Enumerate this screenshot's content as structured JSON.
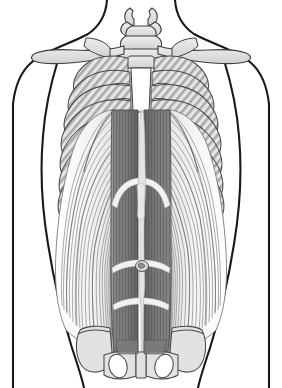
{
  "figure": {
    "view": "anterior",
    "background_color": "#ffffff",
    "outline_color": "#1a1a1a",
    "width": 282,
    "height": 388
  },
  "palette": {
    "body_outline": "#1a1a1a",
    "bone_fill": "#dcdcdc",
    "bone_fill_light": "#e8e8e8",
    "bone_outline": "#4a4a4a",
    "bone_hatch": "#9a9a9a",
    "rectus_fill": "#8c8c8c",
    "rectus_fill_dark": "#6f6f6f",
    "rectus_striation": "#3c3c3c",
    "tendinous_band": "#f2f2f2",
    "oblique_fill": "#f3f3f3",
    "oblique_fiber": "#8e8e8e",
    "oblique_fiber_dark": "#5c5c5c",
    "linea_alba": "#e4e4e4",
    "umbilicus": "#cfcfcf"
  },
  "structures": {
    "body_outline": {
      "label": "torso silhouette",
      "visible": true
    },
    "neck": {
      "label": "neck",
      "visible": true
    },
    "shoulders": {
      "label": "shoulders and upper arms",
      "visible": true
    },
    "vertebrae": {
      "label": "cervical and thoracic vertebrae",
      "count": 3
    },
    "clavicle_left": {
      "label": "left clavicle"
    },
    "clavicle_right": {
      "label": "right clavicle"
    },
    "sternum": {
      "label": "sternum"
    },
    "ribs": {
      "label": "rib cage",
      "pairs": 10
    },
    "costal_margin": {
      "label": "costal margin"
    },
    "rectus_abdominis": {
      "label": "rectus abdominis",
      "sides": 2,
      "striations_per_side": 17,
      "tendinous_intersections": 3
    },
    "linea_alba": {
      "label": "linea alba"
    },
    "external_oblique": {
      "label": "external oblique",
      "sides": 2,
      "fibers_per_side": 22
    },
    "umbilicus": {
      "label": "umbilicus"
    },
    "pelvis": {
      "label": "pelvis / ilium and pubis"
    },
    "pubic_symphysis": {
      "label": "pubic symphysis"
    },
    "obturator_foramen_left": {
      "label": "left obturator foramen"
    },
    "obturator_foramen_right": {
      "label": "right obturator foramen"
    }
  },
  "caption": ""
}
